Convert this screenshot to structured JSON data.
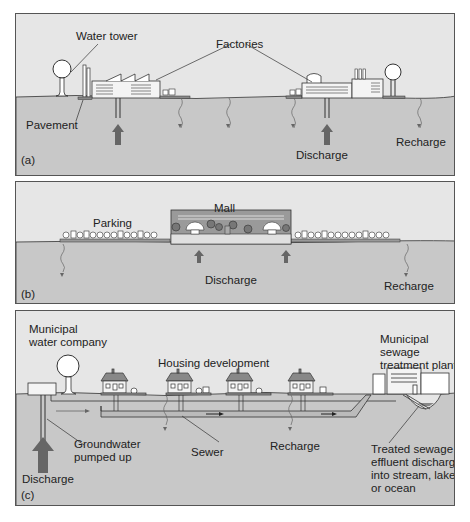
{
  "figure": {
    "panels": [
      {
        "id": "a",
        "tag": "(a)",
        "labels": {
          "water_tower": "Water tower",
          "factories": "Factories",
          "pavement": "Pavement",
          "discharge": "Discharge",
          "recharge": "Recharge"
        }
      },
      {
        "id": "b",
        "tag": "(b)",
        "labels": {
          "mall": "Mall",
          "parking": "Parking",
          "discharge": "Discharge",
          "recharge": "Recharge"
        }
      },
      {
        "id": "c",
        "tag": "(c)",
        "labels": {
          "water_company_1": "Municipal",
          "water_company_2": "water company",
          "housing": "Housing development",
          "sewage_plant_1": "Municipal",
          "sewage_plant_2": "sewage",
          "sewage_plant_3": "treatment plant",
          "groundwater_1": "Groundwater",
          "groundwater_2": "pumped up",
          "sewer": "Sewer",
          "recharge": "Recharge",
          "discharge": "Discharge",
          "effluent_1": "Treated sewage",
          "effluent_2": "effluent discharged",
          "effluent_3": "into stream, lake",
          "effluent_4": "or ocean"
        }
      }
    ],
    "colors": {
      "sky": "#e6e6e6",
      "ground": "#c8c8c8",
      "line": "#333333",
      "arrow": "#666666",
      "building": "#f4f4f4",
      "mall_interior": "#9a9a9a"
    }
  }
}
